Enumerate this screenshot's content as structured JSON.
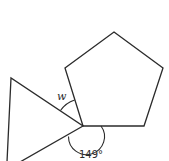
{
  "figure": {
    "shapes": [
      {
        "name": "pentagon",
        "sides": 5,
        "regular": true
      },
      {
        "name": "triangle",
        "sides": 3
      }
    ],
    "labels": {
      "unknown_angle": "w",
      "known_angle": "149°"
    },
    "stroke_color": "#2b2b2b"
  }
}
